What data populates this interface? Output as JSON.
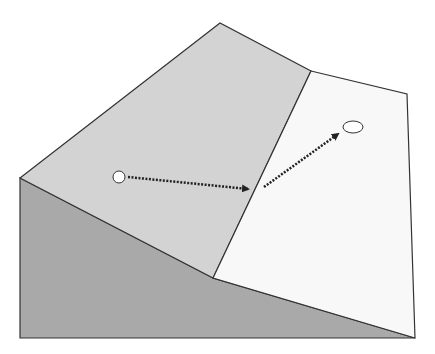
{
  "diagram": {
    "colors": {
      "background": "#ffffff",
      "side_face": "#a9a9a9",
      "upper_slope": "#d3d3d3",
      "lower_slope": "#f8f8f8",
      "edge": "#333333",
      "arrow": "#222222",
      "marker_fill": "#ffffff"
    },
    "faces": {
      "side_face": [
        [
          20,
          178
        ],
        [
          213,
          278
        ],
        [
          415,
          338
        ],
        [
          20,
          338
        ]
      ],
      "upper_slope": [
        [
          20,
          178
        ],
        [
          220,
          23
        ],
        [
          311,
          71
        ],
        [
          213,
          278
        ]
      ],
      "lower_slope": [
        [
          311,
          71
        ],
        [
          407,
          94
        ],
        [
          415,
          338
        ],
        [
          213,
          278
        ]
      ]
    },
    "markers": [
      {
        "name": "start-point",
        "cx": 119,
        "cy": 177,
        "rx": 6,
        "ry": 6
      },
      {
        "name": "end-point",
        "cx": 353,
        "cy": 127,
        "rx": 10,
        "ry": 6
      }
    ],
    "arrows": [
      {
        "name": "arrow-segment-1",
        "x1": 128,
        "y1": 177,
        "x2": 248,
        "y2": 189
      },
      {
        "name": "arrow-segment-2",
        "x1": 264,
        "y1": 187,
        "x2": 338,
        "y2": 134
      }
    ]
  }
}
